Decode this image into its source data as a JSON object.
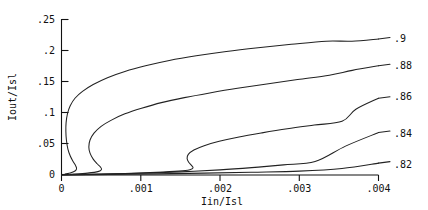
{
  "chart_data": {
    "type": "line",
    "title": "",
    "xlabel": "Iin/Isl",
    "ylabel": "Iout/Isl",
    "xlim": [
      0,
      0.004
    ],
    "ylim": [
      0,
      0.25
    ],
    "grid": false,
    "legend_position": "right-of-curve-ends",
    "xticks": [
      0,
      0.001,
      0.002,
      0.003,
      0.004
    ],
    "xticklabels": [
      "0",
      ".001",
      ".002",
      ".003",
      ".004"
    ],
    "yticks": [
      0,
      0.05,
      0.1,
      0.15,
      0.2,
      0.25
    ],
    "yticklabels": [
      "0",
      ".05",
      ".1",
      ".15",
      ".2",
      ".25"
    ],
    "series": [
      {
        "name": ".9",
        "label": ".9",
        "end_value": 0.218,
        "points": [
          [
            4.5e-05,
            0.0015
          ],
          [
            0.00012,
            0.0035
          ],
          [
            0.000175,
            0.0068
          ],
          [
            0.00019,
            0.0105
          ],
          [
            0.000178,
            0.015
          ],
          [
            0.00015,
            0.021
          ],
          [
            0.000112,
            0.03
          ],
          [
            8e-05,
            0.042
          ],
          [
            6.2e-05,
            0.056
          ],
          [
            5.5e-05,
            0.07
          ],
          [
            5.8e-05,
            0.084
          ],
          [
            7.5e-05,
            0.098
          ],
          [
            0.00011,
            0.111
          ],
          [
            0.00017,
            0.123
          ],
          [
            0.000265,
            0.134
          ],
          [
            0.0004,
            0.145
          ],
          [
            0.00058,
            0.156
          ],
          [
            0.0008,
            0.166
          ],
          [
            0.00106,
            0.175
          ],
          [
            0.00136,
            0.1835
          ],
          [
            0.0017,
            0.191
          ],
          [
            0.00208,
            0.198
          ],
          [
            0.00248,
            0.204
          ],
          [
            0.0029,
            0.2095
          ],
          [
            0.00334,
            0.2145
          ],
          [
            0.00378,
            0.218
          ],
          [
            0.004,
            0.219
          ]
        ]
      },
      {
        "name": ".88",
        "label": ".88",
        "end_value": 0.175,
        "points": [
          [
            0.00011,
            0.0012
          ],
          [
            0.00033,
            0.003
          ],
          [
            0.00047,
            0.0058
          ],
          [
            0.000505,
            0.0092
          ],
          [
            0.00049,
            0.013
          ],
          [
            0.00045,
            0.018
          ],
          [
            0.0004,
            0.0255
          ],
          [
            0.00036,
            0.035
          ],
          [
            0.000345,
            0.045
          ],
          [
            0.00036,
            0.056
          ],
          [
            0.00041,
            0.067
          ],
          [
            0.0005,
            0.078
          ],
          [
            0.00063,
            0.088
          ],
          [
            0.0008,
            0.098
          ],
          [
            0.00101,
            0.107
          ],
          [
            0.00126,
            0.116
          ],
          [
            0.00155,
            0.124
          ],
          [
            0.00187,
            0.1315
          ],
          [
            0.00222,
            0.139
          ],
          [
            0.00259,
            0.146
          ],
          [
            0.00298,
            0.153
          ],
          [
            0.00338,
            0.16
          ],
          [
            0.00379,
            0.1665
          ],
          [
            0.004,
            0.17
          ]
        ]
      },
      {
        "name": ".86",
        "label": ".86",
        "end_value": 0.123,
        "points": [
          [
            0.0003,
            0.001
          ],
          [
            0.0008,
            0.0025
          ],
          [
            0.0012,
            0.0042
          ],
          [
            0.00148,
            0.0062
          ],
          [
            0.00162,
            0.0085
          ],
          [
            0.00166,
            0.0115
          ],
          [
            0.00164,
            0.0155
          ],
          [
            0.001605,
            0.0205
          ],
          [
            0.001585,
            0.0265
          ],
          [
            0.0016,
            0.033
          ],
          [
            0.00167,
            0.04
          ],
          [
            0.0018,
            0.047
          ],
          [
            0.00199,
            0.054
          ],
          [
            0.00224,
            0.061
          ],
          [
            0.00253,
            0.0675
          ],
          [
            0.00285,
            0.074
          ],
          [
            0.00319,
            0.08
          ],
          [
            0.00354,
            0.086
          ],
          [
            0.00389,
            0.0915
          ],
          [
            0.004,
            0.093
          ]
        ]
      },
      {
        "name": ".84",
        "label": ".84",
        "end_value": 0.068,
        "points": [
          [
            0.0,
            0.0
          ],
          [
            0.0005,
            0.0012
          ],
          [
            0.001,
            0.0028
          ],
          [
            0.0015,
            0.005
          ],
          [
            0.002,
            0.0082
          ],
          [
            0.0024,
            0.0118
          ],
          [
            0.0028,
            0.0162
          ],
          [
            0.0032,
            0.0215
          ],
          [
            0.0036,
            0.0275
          ],
          [
            0.004,
            0.0345
          ]
        ]
      },
      {
        "name": ".82",
        "label": ".82",
        "end_value": 0.019,
        "points": [
          [
            0.0,
            0.0
          ],
          [
            0.0006,
            0.0008
          ],
          [
            0.0012,
            0.0018
          ],
          [
            0.0018,
            0.003
          ],
          [
            0.0024,
            0.0045
          ],
          [
            0.003,
            0.0062
          ],
          [
            0.0035,
            0.0078
          ],
          [
            0.004,
            0.0098
          ]
        ]
      }
    ]
  },
  "axes": {
    "ylabel": "Iout/Isl",
    "xlabel": "Iin/Isl",
    "ytick0": ".25",
    "ytick1": ".2",
    "ytick2": ".15",
    "ytick3": ".1",
    "ytick4": ".05",
    "ytick5": "0",
    "xtick0": "0",
    "xtick1": ".001",
    "xtick2": ".002",
    "xtick3": ".003",
    "xtick4": ".004"
  },
  "curve_labels": {
    "l0": ".9",
    "l1": ".88",
    "l2": ".86",
    "l3": ".84",
    "l4": ".82"
  },
  "colors": {
    "ink": "#1a1a1a",
    "curve": "#222222",
    "background": "#ffffff"
  }
}
